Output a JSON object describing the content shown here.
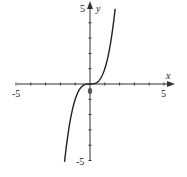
{
  "chart_data": {
    "type": "line",
    "title": "",
    "xlabel": "x",
    "ylabel": "y",
    "xlim": [
      -5,
      5
    ],
    "ylim": [
      -5,
      5
    ],
    "grid": false,
    "tick_labels": {
      "x_min": "-5",
      "x_max": "5",
      "y_max": "5",
      "y_min": "-5",
      "origin": "0"
    },
    "series": [
      {
        "name": "y = x^3",
        "x": [
          -1.7,
          -1.5,
          -1.0,
          -0.5,
          0,
          0.5,
          1.0,
          1.5,
          1.7
        ],
        "values": [
          -4.9,
          -3.375,
          -1,
          -0.125,
          0,
          0.125,
          1,
          3.375,
          4.9
        ]
      }
    ]
  }
}
